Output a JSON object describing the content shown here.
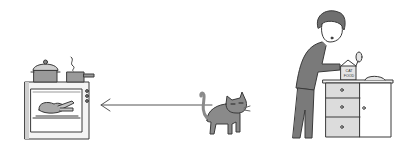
{
  "illustration": {
    "description": "Cartoon: a cat walks away from a person opening a box of cat food, heading toward an oven with a roasting chicken.",
    "elements": {
      "oven": "oven with roasting chicken inside, pots on top with steam",
      "arrow": "arrow pointing left from cat toward oven",
      "cat": "grey cat walking left, looking at viewer",
      "person": "person opening a box at a kitchen counter",
      "box": {
        "label": "CAT FOOD"
      },
      "counter": "kitchen cabinet with three drawers and a door"
    },
    "colors": {
      "line": "#3a3a3a",
      "grey_fill": "#9a9a9a",
      "dark_fill": "#6f6f6f",
      "light_fill": "#d4d4d4",
      "background": "#ffffff"
    }
  }
}
